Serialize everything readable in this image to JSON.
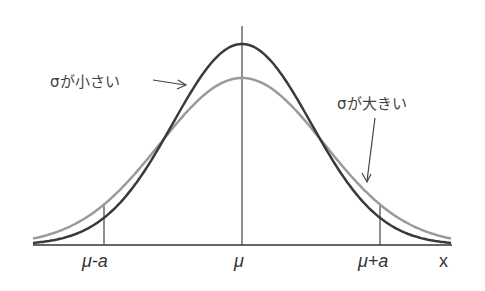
{
  "figure": {
    "annotations": {
      "small_sigma": "σが小さい",
      "large_sigma": "σが大きい"
    },
    "x_ticks": {
      "left": "μ-a",
      "center": "μ",
      "right": "μ+a"
    },
    "x_axis_label": "x",
    "colors": {
      "small_sigma_curve": "#3a3a3a",
      "large_sigma_curve": "#9a9a9a",
      "axis": "#555555"
    }
  },
  "chart_data": {
    "type": "line",
    "title": "",
    "xlabel": "x",
    "ylabel": "",
    "x_ticks": [
      "μ-a",
      "μ",
      "μ+a"
    ],
    "series": [
      {
        "name": "σが小さい (small σ)",
        "shape": "normal",
        "relative_peak": 1.0,
        "relative_sigma": 0.5
      },
      {
        "name": "σが大きい (large σ)",
        "shape": "normal",
        "relative_peak": 0.83,
        "relative_sigma": 0.6
      }
    ],
    "grid": false,
    "legend": "annotated with arrows"
  }
}
